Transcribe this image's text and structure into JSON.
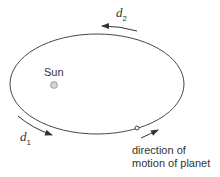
{
  "diagram": {
    "sun_label": "Sun",
    "d1_label": "d",
    "d1_sub": "1",
    "d2_label": "d",
    "d2_sub": "2",
    "motion_label_line1": "direction of",
    "motion_label_line2": "motion of planet",
    "colors": {
      "line": "#333333",
      "sun": "#b0b0b0",
      "text": "#333333"
    }
  }
}
